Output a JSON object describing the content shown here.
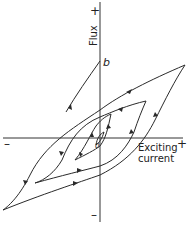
{
  "figure": {
    "type": "hysteresis-loops",
    "labels": {
      "y_axis": "Flux",
      "y_plus": "+",
      "y_minus": "–",
      "x_axis_line1": "Exciting",
      "x_axis_line2": "current",
      "x_plus": "+",
      "x_minus": "–",
      "point_b": "b",
      "origin": "0"
    },
    "colors": {
      "line": "#2a2a2a",
      "background": "#ffffff"
    },
    "loops": [
      {
        "name": "outer-loop",
        "tip_top_right": [
          185,
          65
        ],
        "tip_bottom_left": [
          3,
          210
        ]
      },
      {
        "name": "middle-loop",
        "tip_top_right": [
          146,
          101
        ],
        "tip_bottom_left": [
          35,
          183
        ]
      },
      {
        "name": "inner-loop",
        "tip_top_right": [
          111,
          114
        ],
        "tip_bottom_left": [
          75,
          160
        ]
      },
      {
        "name": "innermost-loop",
        "tip_top_right": [
          104,
          132
        ],
        "tip_bottom_left": [
          96,
          145
        ]
      }
    ]
  }
}
